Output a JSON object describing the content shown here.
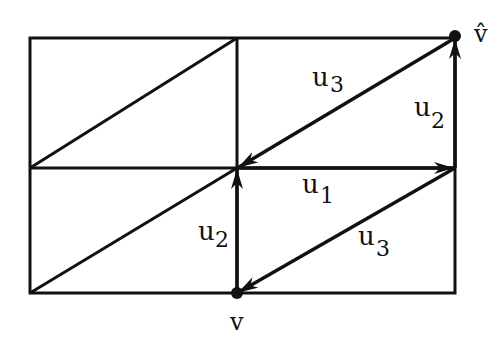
{
  "diagram": {
    "type": "grid-graph-with-vectors",
    "grid": {
      "cols": 2,
      "rows": 2,
      "x": [
        30,
        237,
        455
      ],
      "y": [
        38,
        168,
        293
      ]
    },
    "line_color": "#111111",
    "labels": {
      "v_hat": "v̂",
      "v": "v",
      "u3_top": "u",
      "u3_top_sub": "3",
      "u2_right": "u",
      "u2_right_sub": "2",
      "u1": "u",
      "u1_sub": "1",
      "u2_left": "u",
      "u2_left_sub": "2",
      "u3_bottom": "u",
      "u3_bottom_sub": "3"
    },
    "vertices": [
      {
        "name": "v",
        "x": 237,
        "y": 293
      },
      {
        "name": "v_hat",
        "x": 455,
        "y": 36
      }
    ],
    "arrows": [
      {
        "label": "u3",
        "from": [
          455,
          38
        ],
        "to": [
          237,
          168
        ]
      },
      {
        "label": "u2",
        "from": [
          455,
          168
        ],
        "to": [
          455,
          38
        ]
      },
      {
        "label": "u1",
        "from": [
          237,
          168
        ],
        "to": [
          455,
          168
        ]
      },
      {
        "label": "u2",
        "from": [
          237,
          293
        ],
        "to": [
          237,
          168
        ]
      },
      {
        "label": "u3",
        "from": [
          455,
          168
        ],
        "to": [
          237,
          293
        ]
      }
    ]
  }
}
